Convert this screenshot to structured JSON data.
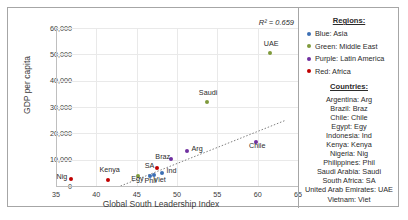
{
  "chart_data": {
    "type": "scatter",
    "title": "",
    "xlabel": "Global South Leadership Index",
    "ylabel": "GDP per capita",
    "xlim": [
      35,
      65
    ],
    "ylim": [
      0,
      60000
    ],
    "xticks": [
      "35",
      "40",
      "45",
      "50",
      "55",
      "60",
      "65"
    ],
    "yticks": [
      "0",
      "10,000",
      "20,000",
      "30,000",
      "40,000",
      "50,000",
      "60,000"
    ],
    "grid": true,
    "annotation": "R² = 0.659",
    "trendline": {
      "visible": true,
      "style": "dotted",
      "x0": 43.0,
      "y0": 0,
      "x1": 63.5,
      "y1": 25000
    },
    "points": [
      {
        "label": "Nig",
        "x": 36.8,
        "y": 2500,
        "color": "#c00000",
        "label_dx": -14,
        "label_dy": -3
      },
      {
        "label": "Kenya",
        "x": 41.5,
        "y": 2200,
        "color": "#c00000",
        "label_dx": -9,
        "label_dy": -11
      },
      {
        "label": "Egy",
        "x": 45.2,
        "y": 3700,
        "color": "#7f9a3c",
        "label_dx": -7,
        "label_dy": 2
      },
      {
        "label": "Phil",
        "x": 46.6,
        "y": 3900,
        "color": "#3d6fb4",
        "label_dx": -5,
        "label_dy": 4
      },
      {
        "label": "Viet",
        "x": 47.1,
        "y": 4300,
        "color": "#3d6fb4",
        "label_dx": 0,
        "label_dy": 4
      },
      {
        "label": "Ind",
        "x": 48.2,
        "y": 4900,
        "color": "#3d6fb4",
        "label_dx": 4,
        "label_dy": -3
      },
      {
        "label": "SA",
        "x": 47.5,
        "y": 6700,
        "color": "#c00000",
        "label_dx": -12,
        "label_dy": -3
      },
      {
        "label": "Braz",
        "x": 49.3,
        "y": 10300,
        "color": "#7030a0",
        "label_dx": -16,
        "label_dy": -3
      },
      {
        "label": "Arg",
        "x": 51.3,
        "y": 13200,
        "color": "#7030a0",
        "label_dx": 4,
        "label_dy": -3
      },
      {
        "label": "Chile",
        "x": 59.8,
        "y": 16800,
        "color": "#7030a0",
        "label_dx": -7,
        "label_dy": 3
      },
      {
        "label": "Saudi",
        "x": 53.7,
        "y": 32000,
        "color": "#7f9a3c",
        "label_dx": -8,
        "label_dy": -10
      },
      {
        "label": "UAE",
        "x": 61.5,
        "y": 50500,
        "color": "#7f9a3c",
        "label_dx": -6,
        "label_dy": -10
      }
    ]
  },
  "legend": {
    "regions_heading": "Regions:",
    "regions": [
      {
        "label": "Blue: Asia",
        "color": "#3d6fb4"
      },
      {
        "label": "Green: Middle East",
        "color": "#7f9a3c"
      },
      {
        "label": "Purple: Latin America",
        "color": "#7030a0"
      },
      {
        "label": "Red: Africa",
        "color": "#c00000"
      }
    ],
    "countries_heading": "Countries:",
    "countries": [
      "Argentina: Arg",
      "Brazil: Braz",
      "Chile: Chile",
      "Egypt: Egy",
      "Indonesia: Ind",
      "Kenya: Kenya",
      "Nigeria: Nig",
      "Philippines: Phil",
      "Saudi Arabia: Saudi",
      "South Africa: SA",
      "United Arab Emirates: UAE",
      "Vietnam: Viet"
    ]
  }
}
